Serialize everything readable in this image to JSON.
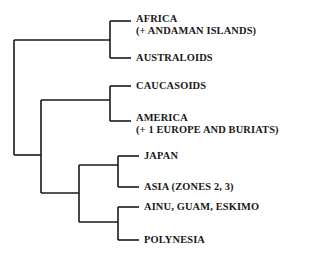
{
  "figure": {
    "type": "cladogram",
    "orientation": "right-facing",
    "background_color": "#ffffff",
    "line_color": "#1a1a1a",
    "text_color": "#181818"
  },
  "leaves": [
    {
      "id": "africa",
      "name": "leaf-label-africa",
      "line1": "AFRICA",
      "line2": "(+ ANDAMAN ISLANDS)",
      "x": 136,
      "y": 13
    },
    {
      "id": "australoids",
      "name": "leaf-label-australoids",
      "line1": "AUSTRALOIDS",
      "line2": "",
      "x": 136,
      "y": 52
    },
    {
      "id": "caucasoids",
      "name": "leaf-label-caucasoids",
      "line1": "CAUCASOIDS",
      "line2": "",
      "x": 136,
      "y": 80
    },
    {
      "id": "america",
      "name": "leaf-label-america",
      "line1": "AMERICA",
      "line2": "(+ 1 EUROPE AND BURIATS)",
      "x": 136,
      "y": 112
    },
    {
      "id": "japan",
      "name": "leaf-label-japan",
      "line1": "JAPAN",
      "line2": "",
      "x": 144,
      "y": 150
    },
    {
      "id": "asia",
      "name": "leaf-label-asia",
      "line1": "ASIA (ZONES 2, 3)",
      "line2": "",
      "x": 144,
      "y": 181
    },
    {
      "id": "ainu",
      "name": "leaf-label-ainu-guam-eskimo",
      "line1": "AINU, GUAM, ESKIMO",
      "line2": "",
      "x": 144,
      "y": 201
    },
    {
      "id": "polynesia",
      "name": "leaf-label-polynesia",
      "line1": "POLYNESIA",
      "line2": "",
      "x": 144,
      "y": 234
    }
  ],
  "tree_geometry": {
    "stroke_width": 1.6,
    "nodes": [
      {
        "id": "root",
        "x": 14,
        "y_top": 40,
        "y_bottom": 155
      },
      {
        "id": "node-eurasia",
        "x": 41,
        "y_top": 100,
        "y_bottom": 193
      },
      {
        "id": "node-pacific",
        "x": 79,
        "y_top": 165,
        "y_bottom": 222
      },
      {
        "id": "clade-africa-australoid",
        "x": 110,
        "y_top": 21,
        "y_bottom": 58
      },
      {
        "id": "clade-caucasoid-america",
        "x": 110,
        "y_top": 86,
        "y_bottom": 121
      },
      {
        "id": "clade-japan-asia",
        "x": 118,
        "y_top": 156,
        "y_bottom": 187
      },
      {
        "id": "clade-ainu-polynesia",
        "x": 118,
        "y_top": 207,
        "y_bottom": 240
      }
    ],
    "branches": [
      {
        "id": "root-to-clade-africa",
        "x1": 14,
        "x2": 110,
        "y": 40
      },
      {
        "id": "root-to-node-eurasia",
        "x1": 14,
        "x2": 41,
        "y": 155
      },
      {
        "id": "eurasia-to-caucasoid",
        "x1": 41,
        "x2": 110,
        "y": 100
      },
      {
        "id": "eurasia-to-pacific",
        "x1": 41,
        "x2": 79,
        "y": 193
      },
      {
        "id": "pacific-to-japan-asia",
        "x1": 79,
        "x2": 118,
        "y": 165
      },
      {
        "id": "pacific-to-ainu-poly",
        "x1": 79,
        "x2": 118,
        "y": 222
      },
      {
        "id": "tip-africa",
        "x1": 110,
        "x2": 131,
        "y": 21
      },
      {
        "id": "tip-australoids",
        "x1": 110,
        "x2": 131,
        "y": 58
      },
      {
        "id": "tip-caucasoids",
        "x1": 110,
        "x2": 131,
        "y": 86
      },
      {
        "id": "tip-america",
        "x1": 110,
        "x2": 131,
        "y": 121
      },
      {
        "id": "tip-japan",
        "x1": 118,
        "x2": 139,
        "y": 156
      },
      {
        "id": "tip-asia",
        "x1": 118,
        "x2": 139,
        "y": 187
      },
      {
        "id": "tip-ainu",
        "x1": 118,
        "x2": 139,
        "y": 207
      },
      {
        "id": "tip-polynesia",
        "x1": 118,
        "x2": 139,
        "y": 240
      }
    ]
  }
}
